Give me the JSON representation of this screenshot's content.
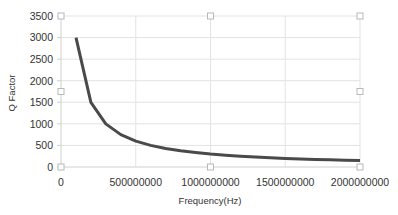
{
  "chart_data": {
    "type": "line",
    "title": "",
    "xlabel": "Frequency(Hz)",
    "ylabel": "Q Factor",
    "xlim": [
      0,
      2000000000
    ],
    "ylim": [
      0,
      3500
    ],
    "x_ticks": [
      0,
      500000000,
      1000000000,
      1500000000,
      2000000000
    ],
    "x_tick_labels": [
      "0",
      "500000000",
      "1000000000",
      "1500000000",
      "2000000000"
    ],
    "y_ticks": [
      0,
      500,
      1000,
      1500,
      2000,
      2500,
      3000,
      3500
    ],
    "y_tick_labels": [
      "0",
      "500",
      "1000",
      "1500",
      "2000",
      "2500",
      "3000",
      "3500"
    ],
    "grid": true,
    "legend": "none",
    "series": [
      {
        "name": "Q Factor",
        "color": "#4a4a4a",
        "x": [
          100000000,
          200000000,
          300000000,
          400000000,
          500000000,
          600000000,
          700000000,
          800000000,
          900000000,
          1000000000,
          1100000000,
          1200000000,
          1300000000,
          1400000000,
          1500000000,
          1600000000,
          1700000000,
          1800000000,
          1900000000,
          2000000000
        ],
        "values": [
          3000,
          1500,
          1000,
          750,
          600,
          500,
          428.6,
          375,
          333.3,
          300,
          272.7,
          250,
          230.8,
          214.3,
          200,
          187.5,
          176.5,
          166.7,
          157.9,
          150
        ]
      }
    ]
  },
  "colors": {
    "line": "#4a4a4a",
    "grid": "#e3e3e3",
    "axis": "#d0d0d0",
    "handle_stroke": "#b8b8b8",
    "text": "#333333"
  }
}
